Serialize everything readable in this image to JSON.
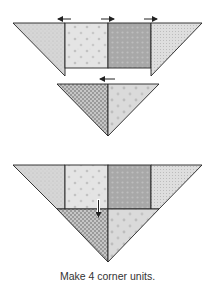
{
  "caption": "Make 4 corner units.",
  "colors": {
    "stroke": "#222222",
    "fabric_light_dots": "#d4d4d4",
    "fabric_star_print": "#e2e2e2",
    "fabric_medium_dots": "#a9a9a9",
    "fabric_check": "#b4b4b4",
    "fabric_speckle": "#dcdcdc"
  },
  "steps": [
    {
      "name": "row-of-setting-triangles-and-squares",
      "pressing_arrows": [
        "left",
        "right",
        "right"
      ]
    },
    {
      "name": "half-square-triangle-unit",
      "pressing_arrows": [
        "left"
      ]
    },
    {
      "name": "joined-corner-unit",
      "pressing_arrows": [
        "down"
      ]
    }
  ]
}
